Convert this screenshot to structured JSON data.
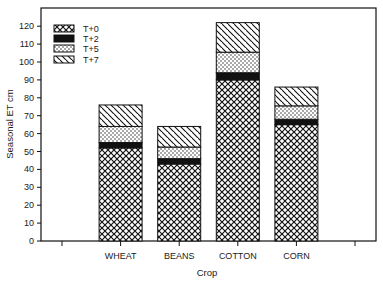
{
  "chart_data": {
    "type": "bar",
    "stacked": true,
    "title": "",
    "xlabel": "Crop",
    "ylabel": "Seasonal ET cm",
    "ylim": [
      0,
      130
    ],
    "yticks": [
      0,
      10,
      20,
      30,
      40,
      50,
      60,
      70,
      80,
      90,
      100,
      110,
      120
    ],
    "categories": [
      "WHEAT",
      "BEANS",
      "COTTON",
      "CORN"
    ],
    "grid": false,
    "legend_position": "top-left",
    "series": [
      {
        "name": "T+0",
        "pattern": "crosshatch",
        "values": [
          52,
          43,
          90,
          65
        ]
      },
      {
        "name": "T+2",
        "pattern": "solid-black",
        "values": [
          3,
          3,
          4,
          3
        ]
      },
      {
        "name": "T+5",
        "pattern": "dots",
        "values": [
          9,
          6.5,
          11.5,
          7.5
        ]
      },
      {
        "name": "T+7",
        "pattern": "diagonal-hatch",
        "values": [
          12,
          11.5,
          16.5,
          10.5
        ]
      }
    ],
    "totals": [
      76,
      64,
      122,
      86
    ]
  },
  "colors": {
    "ink": "#111111",
    "background": "#ffffff"
  }
}
